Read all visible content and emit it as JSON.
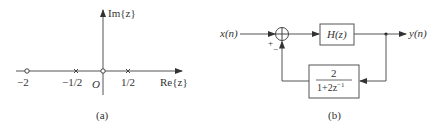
{
  "panel_a": {
    "caption": "(a)",
    "axes": {
      "imag_label": "Im{z}",
      "real_label": "Re{z}",
      "origin_label": "O"
    },
    "markers": [
      {
        "type": "zero",
        "symbol": "o",
        "value": -2,
        "label": "−2"
      },
      {
        "type": "pole",
        "symbol": "x",
        "value": -0.5,
        "label": "−1/2"
      },
      {
        "type": "zero",
        "symbol": "o",
        "value": 0,
        "label": ""
      },
      {
        "type": "pole",
        "symbol": "x",
        "value": 0.5,
        "label": "1/2"
      }
    ]
  },
  "panel_b": {
    "caption": "(b)",
    "input_label": "x(n)",
    "output_label": "y(n)",
    "forward_block": "H(z)",
    "feedback_block": {
      "numerator": "2",
      "denominator_base": "1+2z",
      "denominator_exp": "−1"
    },
    "summer_signs": {
      "plus": "+",
      "minus": "−"
    }
  }
}
